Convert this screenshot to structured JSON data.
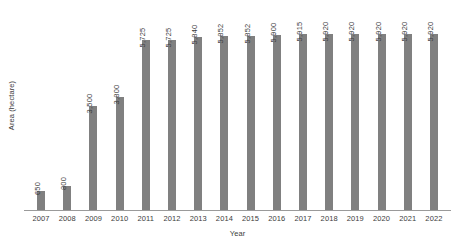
{
  "chart_data": {
    "type": "bar",
    "title": "",
    "xlabel": "Year",
    "ylabel": "Area (hectare)",
    "categories": [
      "2007",
      "2008",
      "2009",
      "2010",
      "2011",
      "2012",
      "2013",
      "2014",
      "2015",
      "2016",
      "2017",
      "2018",
      "2019",
      "2020",
      "2021",
      "2022"
    ],
    "values": [
      650,
      800,
      3500,
      3800,
      5725,
      5725,
      5840,
      5852,
      5852,
      5900,
      5915,
      5920,
      5920,
      5920,
      5920,
      5920
    ],
    "value_labels": [
      "650",
      "800",
      "3,500",
      "3,800",
      "5,725",
      "5,725",
      "5,840",
      "5,852",
      "5,852",
      "5,900",
      "5,915",
      "5,920",
      "5,920",
      "5,920",
      "5,920",
      "5,920"
    ],
    "ylim": [
      0,
      6600
    ],
    "grid": false,
    "legend": false,
    "bar_color": "#808080",
    "axis_color": "#9a9a9a",
    "text_color": "#3c3c3c",
    "label_orientation": "vertical"
  }
}
